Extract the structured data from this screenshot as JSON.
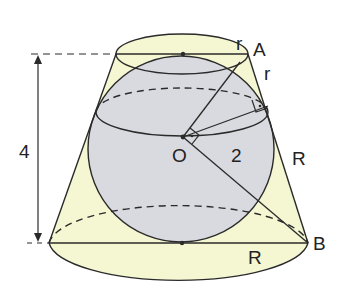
{
  "figure": {
    "type": "geometry",
    "colors": {
      "cone_fill": "#f5f6d2",
      "sphere_fill": "#d9dadf",
      "stroke": "#2a2a2a",
      "background": "#ffffff"
    },
    "labels": {
      "top_radius": "r",
      "point_a": "A",
      "slant_top_segment": "r",
      "center": "O",
      "sphere_radius": "2",
      "slant_bottom_segment": "R",
      "point_b": "B",
      "bottom_radius": "R",
      "height": "4"
    }
  }
}
